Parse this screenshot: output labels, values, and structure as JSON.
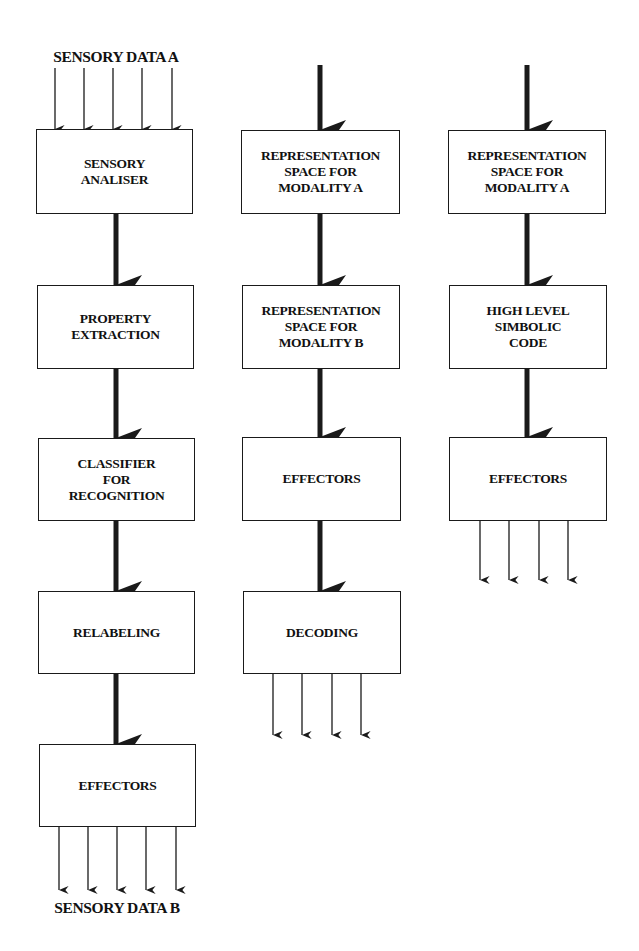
{
  "diagram": {
    "type": "flowchart",
    "columns": [
      {
        "id": "column-1",
        "input_label": "SENSORY DATA A",
        "output_label": "SENSORY DATA B",
        "boxes": [
          "SENSORY\nANALISER",
          "PROPERTY\nEXTRACTION",
          "CLASSIFIER\nFOR\nRECOGNITION",
          "RELABELING",
          "EFFECTORS"
        ],
        "input_arrow_count": 5,
        "output_arrow_count": 5
      },
      {
        "id": "column-2",
        "boxes": [
          "REPRESENTATION\nSPACE FOR\nMODALITY A",
          "REPRESENTATION\nSPACE FOR\nMODALITY B",
          "EFFECTORS",
          "DECODING"
        ],
        "output_arrow_count": 4
      },
      {
        "id": "column-3",
        "boxes": [
          "REPRESENTATION\nSPACE FOR\nMODALITY A",
          "HIGH LEVEL\nSIMBOLIC\nCODE",
          "EFFECTORS"
        ],
        "output_arrow_count": 4
      }
    ],
    "colors": {
      "line": "#1a1a1a",
      "background": "#ffffff"
    }
  }
}
